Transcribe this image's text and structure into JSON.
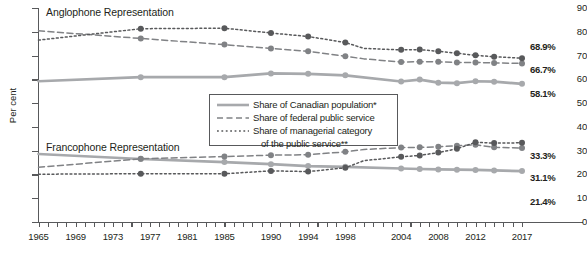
{
  "chart_data": {
    "type": "line",
    "title": "",
    "xlabel": "",
    "ylabel": "Per cent",
    "ylim": [
      0,
      90
    ],
    "ytick_values": [
      90,
      80,
      70,
      60,
      50,
      40,
      30,
      20,
      10,
      0
    ],
    "xlim": [
      1965,
      2017
    ],
    "xtick_labels": [
      "1965",
      "1969",
      "1973",
      "1977",
      "1981",
      "1985",
      "1990",
      "1994",
      "1998",
      "2004",
      "2008",
      "2012",
      "2017"
    ],
    "xtick_values": [
      1965,
      1969,
      1973,
      1977,
      1981,
      1985,
      1990,
      1994,
      1998,
      2004,
      2008,
      2012,
      2017
    ],
    "grid": false,
    "legend_position": "center",
    "annotations": [
      "Anglophone Representation",
      "Francophone Representation"
    ],
    "series": [
      {
        "name": "Share of Canadian population*",
        "group": "Anglophone Representation",
        "style": "solid",
        "color": "#a7a9ac",
        "x": [
          1965,
          1976,
          1985,
          1990,
          1994,
          1998,
          2004,
          2006,
          2008,
          2010,
          2012,
          2014,
          2017
        ],
        "values": [
          59.2,
          60.9,
          60.9,
          62.5,
          62.3,
          61.7,
          59.1,
          59.9,
          58.6,
          58.4,
          59.2,
          59.0,
          58.1
        ],
        "end_label": "58.1%"
      },
      {
        "name": "Share of federal public service",
        "group": "Anglophone Representation",
        "style": "dashed",
        "color": "#808285",
        "x": [
          1965,
          1976,
          1985,
          1990,
          1994,
          1998,
          2000,
          2004,
          2006,
          2008,
          2010,
          2012,
          2014,
          2017
        ],
        "values": [
          80.4,
          77.2,
          74.6,
          73.0,
          71.8,
          69.7,
          68.6,
          67.3,
          67.4,
          67.4,
          67.1,
          67.1,
          66.9,
          66.7
        ],
        "end_label": "66.7%"
      },
      {
        "name": "Share of managerial category of the public service**",
        "group": "Anglophone Representation",
        "style": "dotted",
        "color": "#58595b",
        "x": [
          1965,
          1976,
          1985,
          1990,
          1994,
          1998,
          2000,
          2004,
          2006,
          2008,
          2010,
          2012,
          2014,
          2017
        ],
        "values": [
          76.5,
          81.3,
          81.5,
          79.5,
          78.0,
          75.5,
          73.0,
          72.4,
          72.5,
          71.8,
          71.0,
          70.1,
          69.5,
          68.9
        ],
        "end_label": "68.9%"
      },
      {
        "name": "Share of Canadian population*",
        "group": "Francophone Representation",
        "style": "solid",
        "color": "#a7a9ac",
        "x": [
          1965,
          1976,
          1985,
          1990,
          1994,
          1998,
          2004,
          2006,
          2008,
          2010,
          2012,
          2014,
          2017
        ],
        "values": [
          28.6,
          26.5,
          25.2,
          24.3,
          23.5,
          23.2,
          22.5,
          22.3,
          22.1,
          22.0,
          21.9,
          21.7,
          21.4
        ],
        "end_label": "21.4%"
      },
      {
        "name": "Share of federal public service",
        "group": "Francophone Representation",
        "style": "dashed",
        "color": "#808285",
        "x": [
          1965,
          1976,
          1985,
          1990,
          1994,
          1998,
          2000,
          2004,
          2006,
          2008,
          2010,
          2012,
          2014,
          2017
        ],
        "values": [
          23.0,
          26.6,
          27.5,
          28.1,
          28.3,
          29.5,
          30.5,
          31.3,
          31.4,
          31.6,
          32.1,
          32.5,
          31.4,
          31.1
        ],
        "end_label": "31.1%"
      },
      {
        "name": "Share of managerial category of the public service**",
        "group": "Francophone Representation",
        "style": "dotted",
        "color": "#58595b",
        "x": [
          1965,
          1976,
          1985,
          1990,
          1994,
          1998,
          2000,
          2004,
          2006,
          2008,
          2010,
          2012,
          2014,
          2017
        ],
        "values": [
          20.1,
          20.3,
          20.3,
          21.5,
          21.2,
          22.8,
          25.8,
          27.4,
          28.0,
          29.2,
          30.8,
          33.5,
          33.2,
          33.3
        ],
        "end_label": "33.3%"
      }
    ]
  },
  "axis": {
    "y_title": "Per cent",
    "y_labels": [
      "90",
      "80",
      "70",
      "60",
      "50",
      "40",
      "30",
      "20",
      "10",
      "0"
    ],
    "x_labels": [
      "1965",
      "1969",
      "1973",
      "1977",
      "1981",
      "1985",
      "1990",
      "1994",
      "1998",
      "2004",
      "2008",
      "2012",
      "2017"
    ]
  },
  "captions": {
    "anglophone": "Anglophone Representation",
    "francophone": "Francophone Representation"
  },
  "legend": {
    "items": [
      {
        "label": "Share of Canadian population*",
        "style": "solid",
        "color": "#a7a9ac"
      },
      {
        "label": "Share of federal public service",
        "style": "dashed",
        "color": "#808285"
      },
      {
        "label": "Share of managerial category",
        "style": "dotted",
        "color": "#58595b"
      }
    ],
    "continuation": "of the public service**"
  },
  "end_labels": {
    "anglo_managerial": "68.9%",
    "anglo_federal": "66.7%",
    "anglo_population": "58.1%",
    "franco_managerial": "33.3%",
    "franco_federal": "31.1%",
    "franco_population": "21.4%"
  },
  "colors": {
    "population": "#a7a9ac",
    "federal": "#808285",
    "managerial": "#58595b",
    "axis": "#58595b",
    "text": "#231f20"
  }
}
